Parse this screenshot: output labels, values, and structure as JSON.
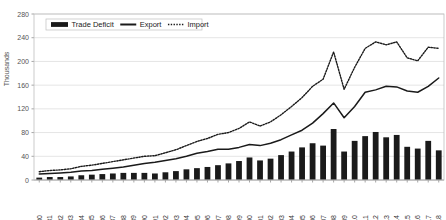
{
  "chart_data": {
    "type": "bar",
    "title": "",
    "subtitle": "",
    "xlabel": "",
    "ylabel": "Thousands",
    "ylim": [
      0,
      280
    ],
    "yticks": [
      0,
      40,
      80,
      120,
      160,
      200,
      240,
      280
    ],
    "grid": true,
    "legend_position": "top-left-inside",
    "categories": [
      "1980",
      "1981",
      "1982",
      "1983",
      "1984",
      "1985",
      "1986",
      "1987",
      "1988",
      "1989",
      "1990",
      "1991",
      "1992",
      "1993",
      "1994",
      "1995",
      "1996",
      "1997",
      "1998",
      "1999",
      "2000",
      "2001",
      "2002",
      "2003",
      "2004",
      "2005",
      "2006",
      "2007",
      "2008",
      "2009",
      "2010",
      "2011",
      "2012",
      "2013",
      "2014",
      "2015",
      "2016",
      "2017",
      "2018"
    ],
    "series": [
      {
        "name": "Trade Deficit",
        "type": "bar",
        "values": [
          4,
          5,
          5,
          6,
          8,
          9,
          10,
          11,
          12,
          12,
          12,
          11,
          13,
          15,
          18,
          20,
          22,
          25,
          28,
          32,
          38,
          33,
          36,
          42,
          48,
          55,
          62,
          58,
          86,
          48,
          66,
          74,
          81,
          72,
          76,
          56,
          53,
          66,
          50
        ]
      },
      {
        "name": "Export",
        "type": "line",
        "values": [
          10,
          11,
          12,
          13,
          15,
          16,
          18,
          20,
          22,
          25,
          28,
          30,
          33,
          36,
          40,
          45,
          48,
          52,
          52,
          55,
          60,
          58,
          62,
          68,
          76,
          84,
          96,
          112,
          130,
          105,
          124,
          148,
          152,
          158,
          157,
          150,
          148,
          158,
          172
        ]
      },
      {
        "name": "Import",
        "type": "line",
        "values": [
          14,
          16,
          17,
          19,
          23,
          25,
          28,
          31,
          34,
          37,
          40,
          41,
          46,
          51,
          58,
          65,
          70,
          77,
          80,
          87,
          98,
          91,
          98,
          110,
          124,
          139,
          158,
          170,
          216,
          153,
          190,
          222,
          233,
          228,
          233,
          206,
          201,
          224,
          222
        ]
      }
    ],
    "legend": [
      {
        "label": "Trade Deficit",
        "marker": "bar-swatch",
        "color": "#1a1a1a"
      },
      {
        "label": "Export",
        "marker": "solid-line",
        "color": "#1a1a1a"
      },
      {
        "label": "Import",
        "marker": "dotted-line",
        "color": "#1a1a1a"
      }
    ],
    "colors": {
      "bar": "#1a1a1a",
      "export_line": "#1a1a1a",
      "import_line": "#1a1a1a",
      "gridline": "#d9d9d9",
      "axis": "#808080",
      "plot_background": "#ffffff",
      "tick_text": "#555555"
    }
  }
}
